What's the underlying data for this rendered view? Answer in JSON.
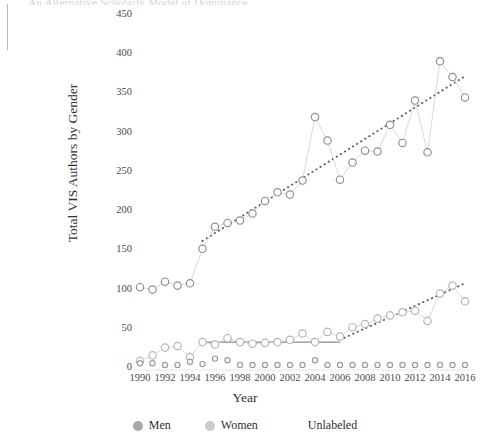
{
  "figure": {
    "title_fragment": "An Alternative Scholarly Model of Dominance",
    "ylabel": "Total VIS Authors by Gender",
    "xlabel": "Year"
  },
  "legend": {
    "position": "bottom-center",
    "entries": [
      {
        "label": "Men",
        "color": "#a9a9a9",
        "marker": "dot"
      },
      {
        "label": "Women",
        "color": "#cbcbcb",
        "marker": "dot"
      },
      {
        "label": "Unlabeled",
        "color": "#ffffff",
        "marker": "none"
      }
    ]
  },
  "axes": {
    "y_ticks": [
      0,
      50,
      100,
      150,
      200,
      250,
      300,
      350,
      400,
      450
    ],
    "x_ticks": [
      1990,
      1992,
      1994,
      1996,
      1998,
      2000,
      2002,
      2004,
      2006,
      2008,
      2010,
      2012,
      2014,
      2016
    ],
    "ylim": [
      0,
      465
    ],
    "xlim": [
      1989.3,
      2016.8
    ],
    "grid": false
  },
  "chart_data": {
    "type": "scatter",
    "title": "An Alternative Scholarly Model of Dominance",
    "xlabel": "Year",
    "ylabel": "Total VIS Authors by Gender",
    "ylim": [
      0,
      465
    ],
    "xlim": [
      1989.3,
      2016.8
    ],
    "grid": false,
    "legend_position": "bottom-center",
    "x": [
      1990,
      1991,
      1992,
      1993,
      1994,
      1995,
      1996,
      1997,
      1998,
      1999,
      2000,
      2001,
      2002,
      2003,
      2004,
      2005,
      2006,
      2007,
      2008,
      2009,
      2010,
      2011,
      2012,
      2013,
      2014,
      2015,
      2016
    ],
    "series": [
      {
        "name": "Men",
        "color": "#8d8d8d",
        "values": [
          103,
          100,
          110,
          105,
          108,
          152,
          180,
          185,
          188,
          197,
          213,
          224,
          221,
          239,
          320,
          290,
          240,
          262,
          277,
          276,
          310,
          287,
          341,
          275,
          391,
          371,
          345
        ],
        "trend": {
          "style": "dotted",
          "x_start": 1995,
          "x_end": 2016,
          "y_start": 162,
          "y_end": 372
        }
      },
      {
        "name": "Women",
        "color": "#b4b4b4",
        "values": [
          9,
          16,
          26,
          28,
          14,
          33,
          30,
          38,
          33,
          31,
          32,
          33,
          36,
          44,
          33,
          46,
          40,
          52,
          56,
          63,
          67,
          71,
          73,
          60,
          95,
          105,
          85
        ],
        "trend_flat": {
          "style": "solid",
          "x_start": 1995,
          "x_end": 2006,
          "y": 33
        },
        "trend": {
          "style": "dotted",
          "x_start": 2006,
          "x_end": 2016,
          "y_start": 36,
          "y_end": 108
        }
      },
      {
        "name": "Unlabeled",
        "color": "#9a9a9a",
        "values": [
          6,
          6,
          4,
          4,
          8,
          5,
          12,
          10,
          4,
          4,
          4,
          4,
          4,
          4,
          10,
          4,
          4,
          4,
          4,
          4,
          4,
          4,
          4,
          4,
          4,
          4,
          4
        ]
      }
    ]
  }
}
